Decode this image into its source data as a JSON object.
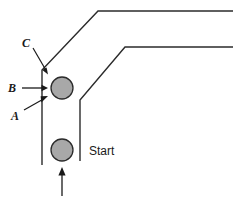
{
  "figure": {
    "background_color": "#ffffff",
    "width": 233,
    "height": 198
  },
  "colors": {
    "stroke": "#2b2b2b",
    "annotation": "#1a1a1a",
    "circle_fill": "#a8a8a8",
    "circle_stroke": "#2b2b2b",
    "background": "#ffffff"
  },
  "labels": {
    "c": "C",
    "b": "B",
    "a": "A",
    "start": "Start"
  },
  "objects": {
    "upper_circle": {
      "cx": 62,
      "cy": 88,
      "r": 11,
      "fill": "#a8a8a8"
    },
    "lower_circle": {
      "cx": 62,
      "cy": 150,
      "r": 11,
      "fill": "#a8a8a8"
    }
  },
  "road": {
    "outer_edge_points": "233,11 98,11 42,70 42,165",
    "inner_edge_points": "233,47 125,47 80,100 80,161"
  },
  "annotations": {
    "c_leader": "33,48 47,72",
    "b_arrow_shaft": "22,88 47,88",
    "a_leader": "24,110 46,96",
    "motion_arrow_shaft": "62,196 62,170"
  }
}
